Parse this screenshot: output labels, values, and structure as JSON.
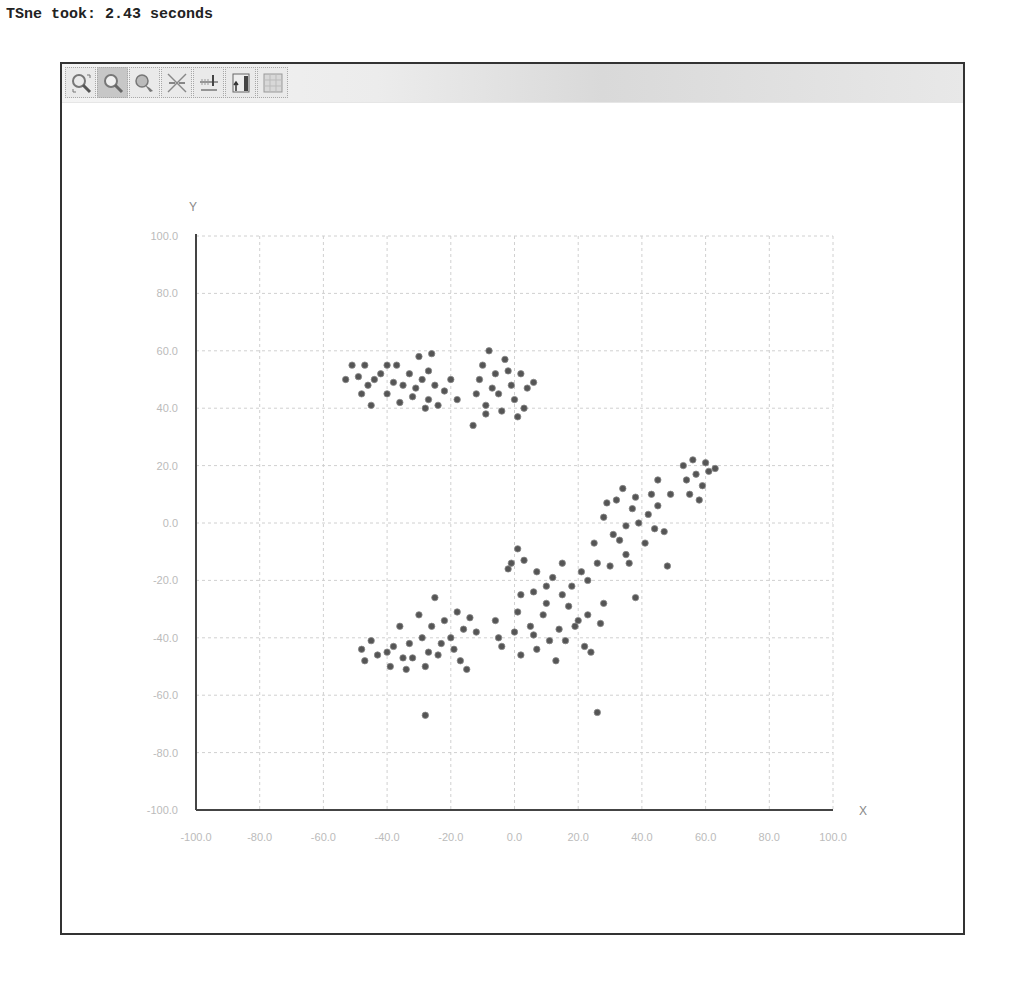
{
  "header": {
    "text": "TSne took: 2.43 seconds"
  },
  "toolbar": {
    "buttons": [
      {
        "name": "zoom-region-button",
        "icon": "zoom-region-icon",
        "active": false
      },
      {
        "name": "zoom-button",
        "icon": "magnifier-icon",
        "active": true
      },
      {
        "name": "pan-button",
        "icon": "hand-pan-icon",
        "active": false
      },
      {
        "name": "reset-scale-button",
        "icon": "reset-axes-icon",
        "active": false
      },
      {
        "name": "axis-settings-button",
        "icon": "axis-scale-icon",
        "active": false
      },
      {
        "name": "export-button",
        "icon": "chart-export-icon",
        "active": false
      },
      {
        "name": "grid-toggle-button",
        "icon": "grid-icon",
        "active": false
      }
    ]
  },
  "colors": {
    "point": "#555555",
    "grid": "#d0d0d0",
    "axis": "#444444",
    "tick_label": "#bbbbbb",
    "axis_label": "#888888"
  },
  "chart_data": {
    "type": "scatter",
    "title": "",
    "xlabel": "X",
    "ylabel": "Y",
    "xlim": [
      -100,
      100
    ],
    "ylim": [
      -100,
      100
    ],
    "grid": true,
    "legend": null,
    "x_ticks": [
      "-100.0",
      "-80.0",
      "-60.0",
      "-40.0",
      "-20.0",
      "0.0",
      "20.0",
      "40.0",
      "60.0",
      "80.0",
      "100.0"
    ],
    "y_ticks": [
      "100.0",
      "80.0",
      "60.0",
      "40.0",
      "20.0",
      "0.0",
      "-20.0",
      "-40.0",
      "-60.0",
      "-80.0",
      "-100.0"
    ],
    "series": [
      {
        "name": "points",
        "points": [
          [
            -53,
            50
          ],
          [
            -51,
            55
          ],
          [
            -49,
            51
          ],
          [
            -48,
            45
          ],
          [
            -47,
            55
          ],
          [
            -46,
            48
          ],
          [
            -45,
            41
          ],
          [
            -44,
            50
          ],
          [
            -42,
            52
          ],
          [
            -40,
            55
          ],
          [
            -40,
            45
          ],
          [
            -38,
            49
          ],
          [
            -37,
            55
          ],
          [
            -36,
            42
          ],
          [
            -35,
            48
          ],
          [
            -33,
            52
          ],
          [
            -32,
            44
          ],
          [
            -31,
            47
          ],
          [
            -30,
            58
          ],
          [
            -29,
            50
          ],
          [
            -28,
            40
          ],
          [
            -27,
            43
          ],
          [
            -27,
            53
          ],
          [
            -26,
            59
          ],
          [
            -25,
            48
          ],
          [
            -24,
            41
          ],
          [
            -22,
            46
          ],
          [
            -20,
            50
          ],
          [
            -18,
            43
          ],
          [
            -13,
            34
          ],
          [
            -12,
            45
          ],
          [
            -11,
            50
          ],
          [
            -10,
            55
          ],
          [
            -9,
            41
          ],
          [
            -9,
            38
          ],
          [
            -8,
            60
          ],
          [
            -7,
            47
          ],
          [
            -6,
            52
          ],
          [
            -5,
            45
          ],
          [
            -4,
            39
          ],
          [
            -3,
            57
          ],
          [
            -2,
            53
          ],
          [
            -1,
            48
          ],
          [
            0,
            43
          ],
          [
            1,
            37
          ],
          [
            2,
            52
          ],
          [
            3,
            40
          ],
          [
            4,
            47
          ],
          [
            6,
            49
          ],
          [
            -48,
            -44
          ],
          [
            -47,
            -48
          ],
          [
            -45,
            -41
          ],
          [
            -43,
            -46
          ],
          [
            -40,
            -45
          ],
          [
            -39,
            -50
          ],
          [
            -38,
            -43
          ],
          [
            -36,
            -36
          ],
          [
            -35,
            -47
          ],
          [
            -34,
            -51
          ],
          [
            -33,
            -42
          ],
          [
            -32,
            -47
          ],
          [
            -30,
            -32
          ],
          [
            -29,
            -40
          ],
          [
            -28,
            -50
          ],
          [
            -27,
            -45
          ],
          [
            -26,
            -36
          ],
          [
            -25,
            -26
          ],
          [
            -24,
            -46
          ],
          [
            -23,
            -42
          ],
          [
            -22,
            -34
          ],
          [
            -20,
            -40
          ],
          [
            -19,
            -44
          ],
          [
            -18,
            -31
          ],
          [
            -17,
            -48
          ],
          [
            -16,
            -37
          ],
          [
            -15,
            -51
          ],
          [
            -14,
            -33
          ],
          [
            -12,
            -38
          ],
          [
            -28,
            -67
          ],
          [
            -6,
            -34
          ],
          [
            -5,
            -40
          ],
          [
            -4,
            -43
          ],
          [
            -2,
            -16
          ],
          [
            -1,
            -14
          ],
          [
            0,
            -38
          ],
          [
            1,
            -9
          ],
          [
            1,
            -31
          ],
          [
            2,
            -46
          ],
          [
            2,
            -25
          ],
          [
            3,
            -13
          ],
          [
            5,
            -36
          ],
          [
            6,
            -39
          ],
          [
            6,
            -24
          ],
          [
            7,
            -17
          ],
          [
            7,
            -44
          ],
          [
            9,
            -32
          ],
          [
            10,
            -22
          ],
          [
            10,
            -28
          ],
          [
            11,
            -41
          ],
          [
            12,
            -19
          ],
          [
            13,
            -48
          ],
          [
            14,
            -37
          ],
          [
            15,
            -25
          ],
          [
            15,
            -14
          ],
          [
            16,
            -41
          ],
          [
            17,
            -29
          ],
          [
            18,
            -22
          ],
          [
            19,
            -36
          ],
          [
            20,
            -34
          ],
          [
            21,
            -17
          ],
          [
            22,
            -43
          ],
          [
            23,
            -32
          ],
          [
            23,
            -20
          ],
          [
            24,
            -45
          ],
          [
            25,
            -7
          ],
          [
            26,
            -14
          ],
          [
            27,
            -35
          ],
          [
            28,
            2
          ],
          [
            28,
            -28
          ],
          [
            29,
            7
          ],
          [
            30,
            -15
          ],
          [
            31,
            -4
          ],
          [
            32,
            8
          ],
          [
            33,
            -6
          ],
          [
            34,
            12
          ],
          [
            35,
            -1
          ],
          [
            35,
            -11
          ],
          [
            36,
            -14
          ],
          [
            37,
            5
          ],
          [
            38,
            9
          ],
          [
            38,
            -26
          ],
          [
            39,
            0
          ],
          [
            41,
            -7
          ],
          [
            42,
            3
          ],
          [
            43,
            10
          ],
          [
            44,
            -2
          ],
          [
            45,
            6
          ],
          [
            45,
            15
          ],
          [
            47,
            -3
          ],
          [
            48,
            -15
          ],
          [
            49,
            10
          ],
          [
            26,
            -66
          ],
          [
            53,
            20
          ],
          [
            54,
            15
          ],
          [
            55,
            10
          ],
          [
            56,
            22
          ],
          [
            57,
            17
          ],
          [
            58,
            8
          ],
          [
            59,
            13
          ],
          [
            60,
            21
          ],
          [
            61,
            18
          ],
          [
            63,
            19
          ]
        ]
      }
    ]
  }
}
